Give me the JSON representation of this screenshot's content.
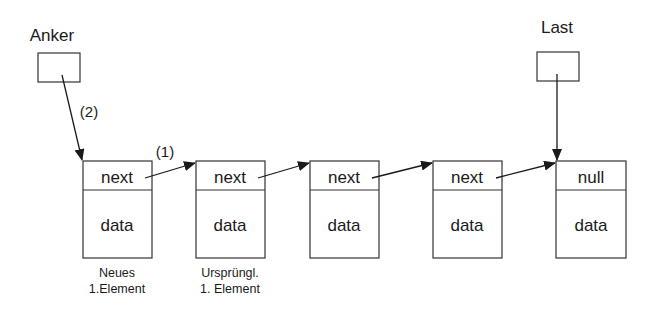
{
  "pointers": [
    {
      "id": "anker",
      "label": "Anker"
    },
    {
      "id": "last",
      "label": "Last"
    }
  ],
  "nodes": [
    {
      "top": "next",
      "bottom": "data",
      "caption": [
        "Neues",
        "1.Element"
      ]
    },
    {
      "top": "next",
      "bottom": "data",
      "caption": [
        "Ursprüngl.",
        "1. Element"
      ]
    },
    {
      "top": "next",
      "bottom": "data",
      "caption": []
    },
    {
      "top": "next",
      "bottom": "data",
      "caption": []
    },
    {
      "top": "null",
      "bottom": "data",
      "caption": []
    }
  ],
  "annotations": {
    "step1": "(1)",
    "step2": "(2)"
  }
}
